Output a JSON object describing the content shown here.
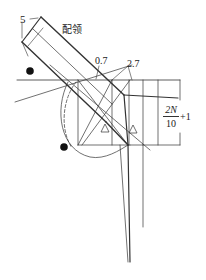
{
  "diagram": {
    "type": "pattern-drafting diagram",
    "labels": {
      "width_mark": "5",
      "collar_label": "配领",
      "offset_small": "0.7",
      "offset_large": "2.7",
      "fraction_numerator": "2N",
      "fraction_denominator": "10",
      "fraction_suffix": "+1"
    },
    "symbols": {
      "dot_marker": "filled-circle",
      "triangle_marker": "triangle-outline"
    },
    "colors": {
      "line": "#333333",
      "background": "#ffffff"
    }
  }
}
